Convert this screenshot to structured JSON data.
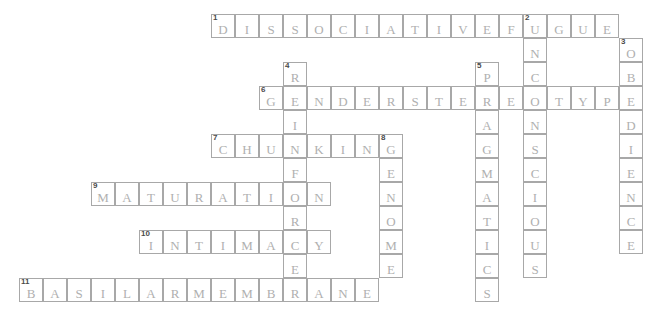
{
  "puzzle": {
    "title": "Psychology Crossword Grid",
    "cell_size": 24,
    "origin_x": 19,
    "origin_y": 14,
    "colors": {
      "cell_border": "#a8a8a8",
      "letter": "#b0b0b0",
      "number": "#4a4a4a",
      "background": "#ffffff"
    },
    "entries": [
      {
        "number": "1",
        "direction": "across",
        "answer": "DISSOCIATIVEFUGUE",
        "display": "DISSOCIATIVE FUGUE",
        "row": 0,
        "col": 8,
        "length": 17
      },
      {
        "number": "2",
        "direction": "down",
        "answer": "UNCONSCIOUS",
        "display": "UNCONSCIOUS",
        "row": 0,
        "col": 21,
        "length": 11
      },
      {
        "number": "3",
        "direction": "down",
        "answer": "OBEDIENCE",
        "display": "OBEDIENCE",
        "row": 1,
        "col": 25,
        "length": 9
      },
      {
        "number": "4",
        "direction": "down",
        "answer": "REINFORCER",
        "display": "REINFORCER",
        "row": 2,
        "col": 11,
        "length": 10
      },
      {
        "number": "5",
        "direction": "down",
        "answer": "PRAGMATICS",
        "display": "PRAGMATICS",
        "row": 2,
        "col": 19,
        "length": 10
      },
      {
        "number": "6",
        "direction": "across",
        "answer": "GENDERSTEREOTYPE",
        "display": "GENDER STEREOTYPE",
        "row": 3,
        "col": 10,
        "length": 16
      },
      {
        "number": "7",
        "direction": "across",
        "answer": "CHUNKING",
        "display": "CHUNKING",
        "row": 5,
        "col": 8,
        "length": 8
      },
      {
        "number": "8",
        "direction": "down",
        "answer": "GENOME",
        "display": "GENOME",
        "row": 5,
        "col": 15,
        "length": 6
      },
      {
        "number": "9",
        "direction": "across",
        "answer": "MATURATION",
        "display": "MATURATION",
        "row": 7,
        "col": 3,
        "length": 10
      },
      {
        "number": "10",
        "direction": "across",
        "answer": "INTIMACY",
        "display": "INTIMACY",
        "row": 9,
        "col": 5,
        "length": 8
      },
      {
        "number": "11",
        "direction": "across",
        "answer": "BASILARMEMBRANE",
        "display": "BASILAR MEMBRANE",
        "row": 11,
        "col": 0,
        "length": 15
      }
    ]
  }
}
